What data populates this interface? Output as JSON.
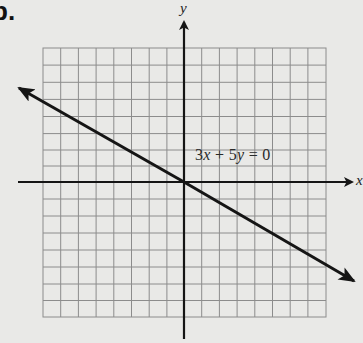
{
  "figure": {
    "part_label": "b.",
    "x_axis_label": "x",
    "y_axis_label": "y",
    "equation": {
      "coef_x": "3",
      "var_x": "x",
      "plus": " + ",
      "coef_y": "5",
      "var_y": "y",
      "rhs": " = 0",
      "full_text": "3x + 5y = 0"
    },
    "grid": {
      "cells_x": 16,
      "cells_y": 16,
      "range_x": [
        -8,
        8
      ],
      "range_y": [
        -8,
        8
      ]
    },
    "line": {
      "slope": -0.6,
      "intercept": 0,
      "arrows": "both"
    },
    "colors": {
      "background": "#e9e9e7",
      "grid": "#8c8c8c",
      "axis": "#151515",
      "line": "#151515"
    }
  }
}
